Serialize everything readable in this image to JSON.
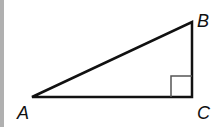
{
  "figure": {
    "type": "right-triangle",
    "vertices": {
      "A": {
        "label": "A",
        "x": 32,
        "y": 97
      },
      "B": {
        "label": "B",
        "x": 192,
        "y": 22
      },
      "C": {
        "label": "C",
        "x": 192,
        "y": 97
      }
    },
    "right_angle_at": "C",
    "right_angle_marker_size": 21,
    "stroke_color": "#111111",
    "marker_color": "#555555",
    "border_color": "#b0b0b0"
  }
}
